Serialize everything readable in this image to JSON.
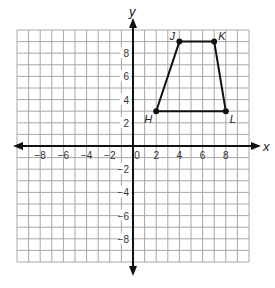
{
  "chart_data": {
    "type": "scatter",
    "title": "",
    "xlabel": "x",
    "ylabel": "y",
    "xlim": [
      -10,
      10
    ],
    "ylim": [
      -10,
      10
    ],
    "grid": true,
    "x_ticks": [
      -8,
      -6,
      -4,
      -2,
      0,
      2,
      4,
      6,
      8
    ],
    "y_ticks": [
      -8,
      -6,
      -4,
      -2,
      2,
      4,
      6,
      8
    ],
    "polygon": {
      "name": "HJKL",
      "shape": "trapezoid",
      "vertices": [
        {
          "label": "H",
          "x": 2,
          "y": 3
        },
        {
          "label": "J",
          "x": 4,
          "y": 9
        },
        {
          "label": "K",
          "x": 7,
          "y": 9
        },
        {
          "label": "L",
          "x": 8,
          "y": 3
        }
      ]
    }
  },
  "colors": {
    "grid": "#a8a8a8",
    "axes": "#111111",
    "shape": "#111111"
  }
}
